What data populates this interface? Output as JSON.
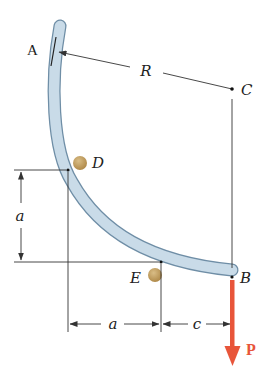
{
  "figure": {
    "points": {
      "A": {
        "label": "A"
      },
      "B": {
        "label": "B"
      },
      "C": {
        "label": "C"
      },
      "D": {
        "label": "D"
      },
      "E": {
        "label": "E"
      }
    },
    "dimensions": {
      "radius": {
        "label": "R"
      },
      "vertical_a": {
        "label": "a"
      },
      "horizontal_a": {
        "label": "a"
      },
      "horizontal_c": {
        "label": "c"
      }
    },
    "load": {
      "label": "P",
      "color": "#e8553a"
    },
    "colors": {
      "bar_fill": "#c9dbe8",
      "bar_edge": "#6f8ea6",
      "pin_fill": "#c9a86a",
      "line": "#333333"
    }
  }
}
